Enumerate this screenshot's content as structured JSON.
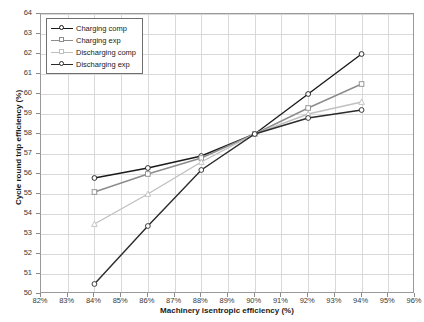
{
  "chart_data": {
    "type": "line",
    "title": "",
    "xlabel": "Machinery isentropic efficiency (%)",
    "ylabel": "Cycle round trip efficiency (%)",
    "x": [
      84,
      86,
      88,
      90,
      92,
      94
    ],
    "xtick_labels": [
      "82%",
      "83%",
      "84%",
      "85%",
      "86%",
      "87%",
      "88%",
      "89%",
      "90%",
      "91%",
      "92%",
      "93%",
      "94%",
      "95%",
      "96%"
    ],
    "xtick_values": [
      82,
      83,
      84,
      85,
      86,
      87,
      88,
      89,
      90,
      91,
      92,
      93,
      94,
      95,
      96
    ],
    "ytick_labels": [
      "50",
      "51",
      "52",
      "53",
      "54",
      "55",
      "56",
      "57",
      "58",
      "59",
      "60",
      "61",
      "62",
      "63",
      "64"
    ],
    "ytick_values": [
      50,
      51,
      52,
      53,
      54,
      55,
      56,
      57,
      58,
      59,
      60,
      61,
      62,
      63,
      64
    ],
    "xlim": [
      82,
      96
    ],
    "ylim": [
      50,
      64
    ],
    "grid": true,
    "legend_position": "top-left-inside",
    "convergence_point": {
      "x": 90,
      "y": 58.0
    },
    "series": [
      {
        "name": "Charging comp",
        "color": "#1a1a1a",
        "marker": "circle",
        "values": [
          55.8,
          56.3,
          56.9,
          58.0,
          60.0,
          62.0
        ]
      },
      {
        "name": "Charging exp",
        "color": "#8c8c8c",
        "marker": "square",
        "values": [
          55.1,
          56.0,
          56.8,
          58.0,
          59.3,
          60.5
        ]
      },
      {
        "name": "Discharging comp",
        "color": "#c0c0c0",
        "marker": "triangle",
        "values": [
          53.5,
          55.0,
          56.6,
          58.0,
          59.0,
          59.6
        ]
      },
      {
        "name": "Discharging exp",
        "color": "#2b2b2b",
        "marker": "circle",
        "values": [
          50.5,
          53.4,
          56.2,
          58.0,
          58.8,
          59.2
        ]
      }
    ]
  },
  "legend": {
    "entries": [
      {
        "label": "Charging comp"
      },
      {
        "label": "Charging exp"
      },
      {
        "label": "Discharging comp"
      },
      {
        "label": "Discharging exp"
      }
    ]
  }
}
